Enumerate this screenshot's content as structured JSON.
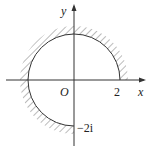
{
  "diagram": {
    "axis_x_label": "x",
    "axis_y_label": "y",
    "origin_label": "O",
    "x_tick_label": "2",
    "y_tick_label": "−2i",
    "colors": {
      "line": "#333333",
      "hatch": "#777777",
      "background": "#ffffff"
    }
  }
}
